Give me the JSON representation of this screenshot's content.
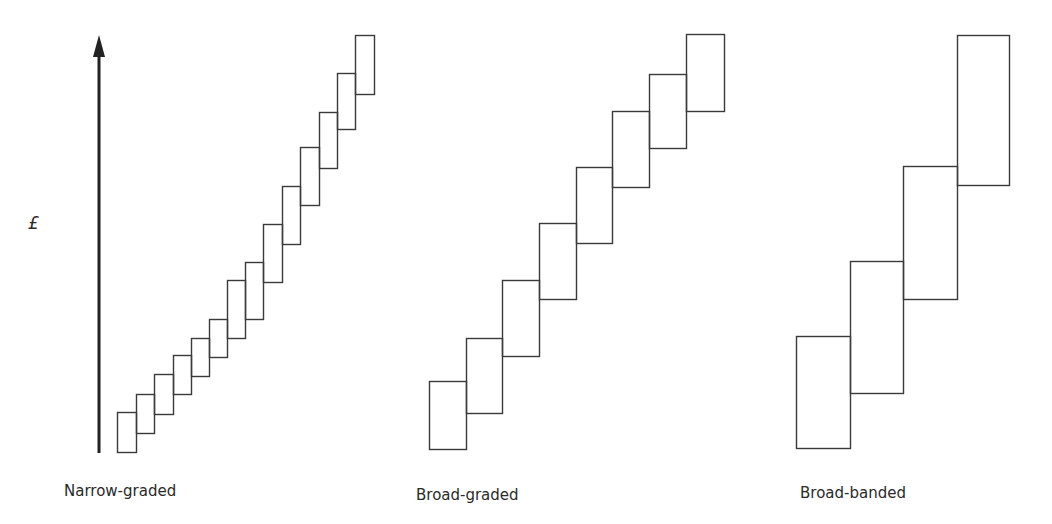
{
  "axis": {
    "label": "£",
    "arrow": {
      "x": 99,
      "y_top": 35,
      "y_bottom": 453
    }
  },
  "panels": [
    {
      "label": "Narrow-graded",
      "label_pos": {
        "x": 64,
        "y": 482
      },
      "boxes": [
        [
          117,
          412,
          19,
          40
        ],
        [
          136,
          394,
          18,
          39
        ],
        [
          154,
          374,
          19,
          40
        ],
        [
          173,
          355,
          18,
          39
        ],
        [
          191,
          338,
          18,
          38
        ],
        [
          209,
          319,
          18,
          38
        ],
        [
          227,
          280,
          18,
          58
        ],
        [
          245,
          262,
          18,
          57
        ],
        [
          263,
          224,
          19,
          58
        ],
        [
          282,
          186,
          18,
          58
        ],
        [
          300,
          147,
          19,
          58
        ],
        [
          319,
          112,
          18,
          56
        ],
        [
          337,
          73,
          18,
          56
        ],
        [
          355,
          35,
          19,
          59
        ]
      ]
    },
    {
      "label": "Broad-graded",
      "label_pos": {
        "x": 416,
        "y": 486
      },
      "boxes": [
        [
          429,
          381,
          37,
          68
        ],
        [
          466,
          338,
          36,
          75
        ],
        [
          502,
          280,
          37,
          76
        ],
        [
          539,
          223,
          37,
          76
        ],
        [
          576,
          167,
          36,
          76
        ],
        [
          612,
          111,
          37,
          76
        ],
        [
          649,
          74,
          37,
          74
        ],
        [
          686,
          34,
          38,
          77
        ]
      ]
    },
    {
      "label": "Broad-banded",
      "label_pos": {
        "x": 800,
        "y": 484
      },
      "boxes": [
        [
          796,
          336,
          54,
          112
        ],
        [
          850,
          261,
          53,
          132
        ],
        [
          903,
          166,
          54,
          133
        ],
        [
          957,
          35,
          52,
          150
        ]
      ]
    }
  ],
  "style": {
    "stroke": "#3a3a3a",
    "axis_color": "#222222"
  }
}
